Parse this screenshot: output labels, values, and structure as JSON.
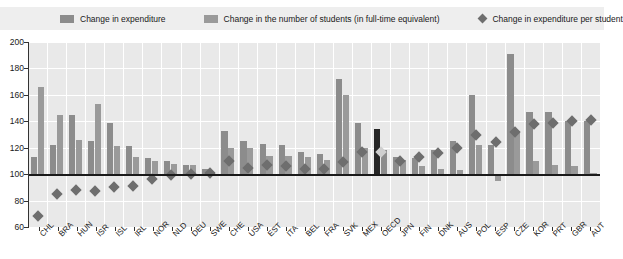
{
  "legend": {
    "items": [
      {
        "label": "Change in expenditure",
        "marker": "square-swatch",
        "color": "#8c8c8c",
        "name": "legend-swatch-expenditure"
      },
      {
        "label": "Change in the number of students (in full-time equivalent)",
        "marker": "square-swatch",
        "color": "#9a9a9a",
        "name": "legend-swatch-students"
      },
      {
        "label": "Change in expenditure per student",
        "marker": "diamond-marker",
        "color": "#6e6e6e",
        "name": "legend-diamond-expenditure-per-student"
      }
    ]
  },
  "chart_data": {
    "type": "bar",
    "title": "",
    "subtitle": "",
    "xlabel": "",
    "ylabel": "",
    "ylim": [
      60,
      200
    ],
    "yticks": [
      60,
      80,
      100,
      120,
      140,
      160,
      180,
      200
    ],
    "ytick_labels": [
      "60",
      "80",
      "100",
      "120",
      "140",
      "160",
      "180",
      "200"
    ],
    "grid": true,
    "reference_line": 100,
    "legend_position": "top",
    "highlight_category": "OECD",
    "categories": [
      "CHL",
      "BRA",
      "HUN",
      "ISR",
      "ISL",
      "IRL",
      "NOR",
      "NLD",
      "DEU",
      "SWE",
      "CHE",
      "USA",
      "EST",
      "ITA",
      "BEL",
      "FRA",
      "SVK",
      "MEX",
      "OECD",
      "JPN",
      "FIN",
      "DNK",
      "AUS",
      "POL",
      "ESP",
      "CZE",
      "KOR",
      "PRT",
      "GBR",
      "AUT"
    ],
    "series": [
      {
        "name": "Change in expenditure",
        "type": "bar",
        "color": "#8c8c8c",
        "values": [
          113,
          122,
          145,
          125,
          139,
          121,
          112,
          110,
          107,
          104,
          133,
          125,
          123,
          122,
          117,
          115,
          172,
          139,
          134,
          113,
          112,
          118,
          125,
          160,
          122,
          191,
          147,
          147,
          140,
          140
        ]
      },
      {
        "name": "Change in the number of students (in full-time equivalent)",
        "type": "bar",
        "color": "#9a9a9a",
        "values": [
          166,
          145,
          126,
          153,
          121,
          113,
          110,
          108,
          107,
          102,
          120,
          120,
          114,
          114,
          113,
          111,
          160,
          120,
          118,
          111,
          106,
          104,
          103,
          122,
          95,
          133,
          110,
          107,
          106,
          101
        ]
      },
      {
        "name": "Change in expenditure per student",
        "type": "scatter-diamond",
        "color": "#6e6e6e",
        "values": [
          68,
          85,
          88,
          87,
          90,
          91,
          96,
          99,
          100,
          101,
          110,
          105,
          107,
          106,
          104,
          104,
          109,
          117,
          117,
          110,
          113,
          116,
          120,
          130,
          124,
          132,
          138,
          139,
          140,
          141
        ]
      }
    ]
  }
}
